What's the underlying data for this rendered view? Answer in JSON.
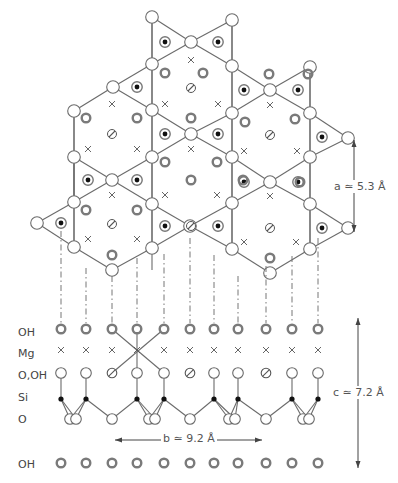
{
  "figure": {
    "row_labels": [
      {
        "id": "oh_top",
        "text": "OH",
        "y": 334
      },
      {
        "id": "mg",
        "text": "Mg",
        "y": 355
      },
      {
        "id": "o_oh",
        "text": "O,OH",
        "y": 377
      },
      {
        "id": "si",
        "text": "Si",
        "y": 399
      },
      {
        "id": "o",
        "text": "O",
        "y": 421
      },
      {
        "id": "oh_bottom",
        "text": "OH",
        "y": 466
      }
    ],
    "dimensions": {
      "a": {
        "text": "a ≃ 5.3 Å",
        "x1": 354,
        "y1": 140,
        "y2": 232
      },
      "b": {
        "text": "b ≃ 9.2 Å",
        "x1": 115,
        "x2": 262,
        "y": 440
      },
      "c": {
        "text": "c ≃ 7.2 Å",
        "x": 358,
        "y1": 318,
        "y2": 468
      }
    },
    "colors": {
      "line": "#6b6b6b",
      "oh_ring": "#7a7a7a",
      "si_dot": "#111111",
      "text": "#444444"
    },
    "columns_x": [
      61,
      86,
      112,
      137,
      164,
      190,
      214,
      238,
      266,
      292,
      318
    ],
    "rows_y": {
      "oh_top": 329,
      "mg": 350,
      "o_oh": 373,
      "si": 399,
      "o": 419,
      "oh_bottom": 463
    },
    "o_oh_types": [
      "o",
      "o",
      "oh",
      "o",
      "o",
      "oh",
      "o",
      "o",
      "oh",
      "o",
      "o"
    ],
    "si_columns": [
      0,
      1,
      3,
      4,
      6,
      7,
      9,
      10
    ],
    "legend_symbols": {
      "open_circle": "O (apical/basal oxygen)",
      "filled_dot": "Si",
      "thick_ring": "OH",
      "cross": "Mg",
      "slashed_circle": "OH (inner)"
    }
  }
}
